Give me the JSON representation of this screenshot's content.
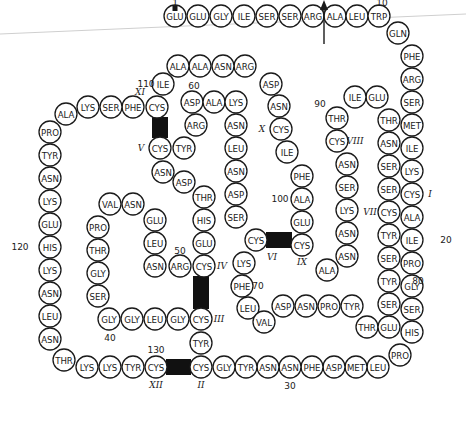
{
  "diagram": {
    "title": "",
    "colors": {
      "stroke": "#1a1a1a",
      "bridge": "#111111",
      "background": "#ffffff",
      "scanline": "#bbbbbb"
    },
    "residues": [
      {
        "n": 1,
        "aa": "GLU"
      },
      {
        "n": 2,
        "aa": "GLU"
      },
      {
        "n": 3,
        "aa": "GLY"
      },
      {
        "n": 4,
        "aa": "ILE"
      },
      {
        "n": 5,
        "aa": "SER"
      },
      {
        "n": 6,
        "aa": "SER"
      },
      {
        "n": 7,
        "aa": "ARG"
      },
      {
        "n": 8,
        "aa": "ALA"
      },
      {
        "n": 9,
        "aa": "LEU"
      },
      {
        "n": 10,
        "aa": "TRP"
      },
      {
        "n": 11,
        "aa": "GLN"
      },
      {
        "n": 12,
        "aa": "PHE"
      },
      {
        "n": 13,
        "aa": "ARG"
      },
      {
        "n": 14,
        "aa": "SER"
      },
      {
        "n": 15,
        "aa": "MET"
      },
      {
        "n": 16,
        "aa": "ILE"
      },
      {
        "n": 17,
        "aa": "LYS"
      },
      {
        "n": 18,
        "aa": "CYS"
      },
      {
        "n": 19,
        "aa": "ALA"
      },
      {
        "n": 20,
        "aa": "ILE"
      },
      {
        "n": 21,
        "aa": "PRO"
      },
      {
        "n": 22,
        "aa": "GLY"
      },
      {
        "n": 23,
        "aa": "SER"
      },
      {
        "n": 24,
        "aa": "HIS"
      },
      {
        "n": 25,
        "aa": "PRO"
      },
      {
        "n": 26,
        "aa": "LEU"
      },
      {
        "n": 27,
        "aa": "MET"
      },
      {
        "n": 28,
        "aa": "ASP"
      },
      {
        "n": 29,
        "aa": "PHE"
      },
      {
        "n": 30,
        "aa": "ASN"
      },
      {
        "n": 31,
        "aa": "ASN"
      },
      {
        "n": 32,
        "aa": "TYR"
      },
      {
        "n": 33,
        "aa": "GLY"
      },
      {
        "n": 34,
        "aa": "CYS"
      },
      {
        "n": 35,
        "aa": "TYR"
      },
      {
        "n": 36,
        "aa": "CYS"
      },
      {
        "n": 37,
        "aa": "GLY"
      },
      {
        "n": 38,
        "aa": "LEU"
      },
      {
        "n": 39,
        "aa": "GLY"
      },
      {
        "n": 40,
        "aa": "GLY"
      },
      {
        "n": 41,
        "aa": "SER"
      },
      {
        "n": 42,
        "aa": "GLY"
      },
      {
        "n": 43,
        "aa": "THR"
      },
      {
        "n": 44,
        "aa": "PRO"
      },
      {
        "n": 45,
        "aa": "VAL"
      },
      {
        "n": 46,
        "aa": "ASN"
      },
      {
        "n": 47,
        "aa": "GLU"
      },
      {
        "n": 48,
        "aa": "LEU"
      },
      {
        "n": 49,
        "aa": "ASN"
      },
      {
        "n": 50,
        "aa": "ARG"
      },
      {
        "n": 51,
        "aa": "CYS"
      },
      {
        "n": 52,
        "aa": "GLU"
      },
      {
        "n": 53,
        "aa": "HIS"
      },
      {
        "n": 54,
        "aa": "THR"
      },
      {
        "n": 55,
        "aa": "ASP"
      },
      {
        "n": 56,
        "aa": "ASN"
      },
      {
        "n": 57,
        "aa": "CYS"
      },
      {
        "n": 58,
        "aa": "TYR"
      },
      {
        "n": 59,
        "aa": "ARG"
      },
      {
        "n": 60,
        "aa": "ASP"
      },
      {
        "n": 61,
        "aa": "ALA"
      },
      {
        "n": 62,
        "aa": "LYS"
      },
      {
        "n": 63,
        "aa": "ASN"
      },
      {
        "n": 64,
        "aa": "LEU"
      },
      {
        "n": 65,
        "aa": "ASN"
      },
      {
        "n": 66,
        "aa": "ASP"
      },
      {
        "n": 67,
        "aa": "SER"
      },
      {
        "n": 68,
        "aa": "CYS"
      },
      {
        "n": 69,
        "aa": "LYS"
      },
      {
        "n": 70,
        "aa": "PHE"
      },
      {
        "n": 71,
        "aa": "LEU"
      },
      {
        "n": 72,
        "aa": "VAL"
      },
      {
        "n": 73,
        "aa": "ASP"
      },
      {
        "n": 74,
        "aa": "ASN"
      },
      {
        "n": 75,
        "aa": "PRO"
      },
      {
        "n": 76,
        "aa": "TYR"
      },
      {
        "n": 77,
        "aa": "THR"
      },
      {
        "n": 78,
        "aa": "GLU"
      },
      {
        "n": 79,
        "aa": "SER"
      },
      {
        "n": 80,
        "aa": "TYR"
      },
      {
        "n": 81,
        "aa": "SER"
      },
      {
        "n": 82,
        "aa": "TYR"
      },
      {
        "n": 83,
        "aa": "CYS"
      },
      {
        "n": 84,
        "aa": "SER"
      },
      {
        "n": 85,
        "aa": "SER"
      },
      {
        "n": 86,
        "aa": "ASN"
      },
      {
        "n": 87,
        "aa": "THR"
      },
      {
        "n": 88,
        "aa": "GLU"
      },
      {
        "n": 89,
        "aa": "ILE"
      },
      {
        "n": 90,
        "aa": "THR"
      },
      {
        "n": 91,
        "aa": "CYS"
      },
      {
        "n": 92,
        "aa": "ASN"
      },
      {
        "n": 93,
        "aa": "SER"
      },
      {
        "n": 94,
        "aa": "LYS"
      },
      {
        "n": 95,
        "aa": "ASN"
      },
      {
        "n": 96,
        "aa": "ASN"
      },
      {
        "n": 97,
        "aa": "ALA"
      },
      {
        "n": 98,
        "aa": "CYS"
      },
      {
        "n": 99,
        "aa": "GLU"
      },
      {
        "n": 100,
        "aa": "ALA"
      },
      {
        "n": 101,
        "aa": "PHE"
      },
      {
        "n": 102,
        "aa": "ILE"
      },
      {
        "n": 103,
        "aa": "CYS"
      },
      {
        "n": 104,
        "aa": "ASN"
      },
      {
        "n": 105,
        "aa": "ASP"
      },
      {
        "n": 106,
        "aa": "ARG"
      },
      {
        "n": 107,
        "aa": "ASN"
      },
      {
        "n": 108,
        "aa": "ALA"
      },
      {
        "n": 109,
        "aa": "ALA"
      },
      {
        "n": 110,
        "aa": "ILE"
      },
      {
        "n": 111,
        "aa": "CYS"
      },
      {
        "n": 112,
        "aa": "PHE"
      },
      {
        "n": 113,
        "aa": "SER"
      },
      {
        "n": 114,
        "aa": "LYS"
      },
      {
        "n": 115,
        "aa": "ALA"
      },
      {
        "n": 116,
        "aa": "PRO"
      },
      {
        "n": 117,
        "aa": "TYR"
      },
      {
        "n": 118,
        "aa": "ASN"
      },
      {
        "n": 119,
        "aa": "LYS"
      },
      {
        "n": 120,
        "aa": "GLU"
      },
      {
        "n": 121,
        "aa": "HIS"
      },
      {
        "n": 122,
        "aa": "LYS"
      },
      {
        "n": 123,
        "aa": "ASN"
      },
      {
        "n": 124,
        "aa": "LEU"
      },
      {
        "n": 125,
        "aa": "ASN"
      },
      {
        "n": 126,
        "aa": "THR"
      },
      {
        "n": 127,
        "aa": "LYS"
      },
      {
        "n": 128,
        "aa": "LYS"
      },
      {
        "n": 129,
        "aa": "TYR"
      },
      {
        "n": 130,
        "aa": "CYS"
      }
    ],
    "position_labels": [
      "1",
      "10",
      "20",
      "30",
      "40",
      "50",
      "60",
      "70",
      "80",
      "90",
      "100",
      "110",
      "120",
      "130"
    ],
    "disulfide_bridges": [
      {
        "from": 18,
        "to": 83,
        "labels": [
          "I",
          "VII"
        ]
      },
      {
        "from": 36,
        "to": 130,
        "labels": [
          "II",
          "XII"
        ]
      },
      {
        "from": 34,
        "to": 51,
        "labels": [
          "III",
          "IV"
        ]
      },
      {
        "from": 57,
        "to": 111,
        "labels": [
          "V",
          "XI"
        ]
      },
      {
        "from": 68,
        "to": 98,
        "labels": [
          "VI",
          "IX"
        ]
      },
      {
        "from": 91,
        "to": 103,
        "labels": [
          "VIII",
          "X"
        ]
      }
    ],
    "cys_labels": {
      "18": "I",
      "36": "II",
      "34": "III",
      "51": "IV",
      "57": "V",
      "68": "VI",
      "83": "VII",
      "91": "VIII",
      "98": "IX",
      "103": "X",
      "111": "XI",
      "130": "XII"
    },
    "cleavage_marker": {
      "between": [
        7,
        8
      ],
      "symbol": "arrow-up"
    },
    "n_terminal_marker": {
      "residue": 1,
      "symbol": "dot"
    }
  }
}
